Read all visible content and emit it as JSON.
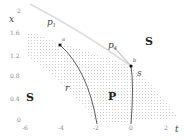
{
  "diagram": {
    "axes": {
      "y_label": "x",
      "x_label": "t",
      "y_ticks": [
        "2",
        "1.6",
        "1.2",
        "0.8",
        "0.4",
        "0"
      ],
      "x_ticks": [
        "-6",
        "-4",
        "-2",
        "0",
        "2"
      ]
    },
    "curves": {
      "p1": "p",
      "p1_sub": "1",
      "p4": "p",
      "p4_sub": "4",
      "r": "r",
      "s": "s"
    },
    "points": {
      "a": "a",
      "b": "b"
    },
    "regions": {
      "s_left": "S",
      "s_right": "S",
      "p": "P"
    }
  }
}
